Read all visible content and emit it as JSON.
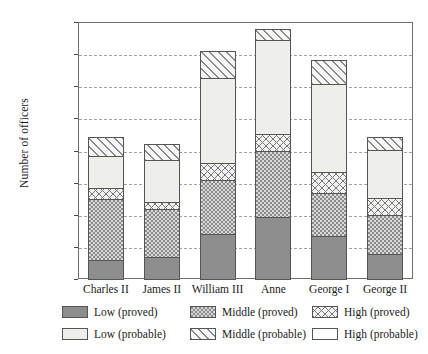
{
  "chart_data": {
    "type": "bar",
    "subtype": "stacked-bar",
    "title": "",
    "xlabel": "",
    "ylabel": "Number of officers",
    "ylim": [
      0,
      400
    ],
    "ytick_step": 50,
    "yticks": [
      0,
      50,
      100,
      150,
      200,
      250,
      300,
      350,
      400
    ],
    "grid": "horizontal-dashed",
    "legend_position": "below-axes",
    "categories": [
      "Charles II",
      "James II",
      "William III",
      "Anne",
      "George I",
      "George II"
    ],
    "series": [
      {
        "name": "Low (proved)",
        "key": "low_proved",
        "values": [
          31,
          36,
          71,
          98,
          68,
          41
        ]
      },
      {
        "name": "Middle (proved)",
        "key": "mid_proved",
        "values": [
          97,
          76,
          87,
          104,
          69,
          61
        ]
      },
      {
        "name": "High (proved)",
        "key": "high_proved",
        "values": [
          19,
          13,
          28,
          28,
          35,
          29
        ]
      },
      {
        "name": "Low (probable)",
        "key": "low_probable",
        "values": [
          50,
          67,
          133,
          148,
          137,
          76
        ]
      },
      {
        "name": "Middle (probable)",
        "key": "mid_probable",
        "values": [
          32,
          26,
          43,
          19,
          39,
          22
        ]
      },
      {
        "name": "High (probable)",
        "key": "high_probable",
        "values": [
          0,
          0,
          0,
          0,
          0,
          0
        ]
      }
    ],
    "totals": [
      229,
      218,
      362,
      397,
      348,
      229
    ]
  },
  "legend": {
    "items": [
      {
        "label": "Low (proved)",
        "swatch": "solid-dark-gray",
        "fill_class": "f-low-proved"
      },
      {
        "label": "Middle (proved)",
        "swatch": "stippled-gray",
        "fill_class": "f-mid-proved"
      },
      {
        "label": "High (proved)",
        "swatch": "crosshatch",
        "fill_class": "f-high-proved"
      },
      {
        "label": "Low (probable)",
        "swatch": "light-gray",
        "fill_class": "f-low-probable"
      },
      {
        "label": "Middle (probable)",
        "swatch": "diagonal-hatch",
        "fill_class": "f-mid-probable"
      },
      {
        "label": "High (probable)",
        "swatch": "white",
        "fill_class": "f-high-probable"
      }
    ]
  },
  "colors": {
    "low_proved": "#8e8e8e",
    "mid_proved": "#d9d9d9",
    "high_proved": "#f2f2f2",
    "low_probable": "#eeeeea",
    "mid_probable": "#f7f7f7",
    "high_probable": "#ffffff",
    "grid": "#9aa3ab",
    "axis": "#6e6e6e",
    "text": "#1a1a1a"
  }
}
